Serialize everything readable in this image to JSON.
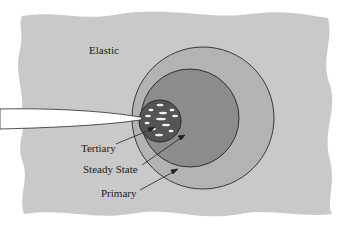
{
  "diagram": {
    "type": "crack-tip creep zones",
    "labels": {
      "elastic": "Elastic",
      "tertiary": "Tertiary",
      "steady_state": "Steady State",
      "primary": "Primary"
    },
    "zones": [
      {
        "name": "Elastic",
        "color": "#c9c9c9"
      },
      {
        "name": "Primary",
        "color": "#b3b3b3"
      },
      {
        "name": "Steady State",
        "color": "#8c8c8c"
      },
      {
        "name": "Tertiary",
        "color": "#545454"
      }
    ],
    "colors": {
      "background": "#ffffff",
      "outline": "#333333",
      "crack": "#ffffff",
      "voids": "#f2f2f2"
    }
  }
}
